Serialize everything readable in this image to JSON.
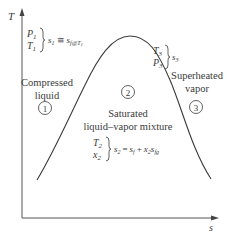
{
  "diagram": {
    "axes": {
      "y_label": "T",
      "x_label": "s"
    },
    "regions": [
      {
        "id": "1",
        "number": "1",
        "label_line1": "Compressed",
        "label_line2": "liquid",
        "state_vars": [
          "P",
          "T"
        ],
        "state_sub": "1",
        "relation_lhs": "s",
        "relation_lhs_sub": "1",
        "relation_op": "≅",
        "relation_rhs": "s",
        "relation_rhs_sub": "f@T",
        "relation_rhs_subsub": "1"
      },
      {
        "id": "2",
        "number": "2",
        "label_line1": "Saturated",
        "label_line2": "liquid–vapor mixture",
        "state_vars": [
          "T",
          "x"
        ],
        "state_sub": "2",
        "relation_lhs": "s",
        "relation_lhs_sub": "2",
        "relation_op": "=",
        "relation_rhs_a": "s",
        "relation_rhs_a_sub": "f",
        "relation_plus": "+",
        "relation_rhs_b": "x",
        "relation_rhs_b_sub": "2",
        "relation_rhs_c": "s",
        "relation_rhs_c_sub": "fg"
      },
      {
        "id": "3",
        "number": "3",
        "label_line1": "Superheated",
        "label_line2": "vapor",
        "state_vars": [
          "T",
          "P"
        ],
        "state_sub": "3",
        "relation_lhs": "s",
        "relation_lhs_sub": "3"
      }
    ],
    "colors": {
      "line": "#3a3a3a",
      "axis": "#555555",
      "text": "#3a3a3a",
      "background": "#ffffff"
    }
  }
}
